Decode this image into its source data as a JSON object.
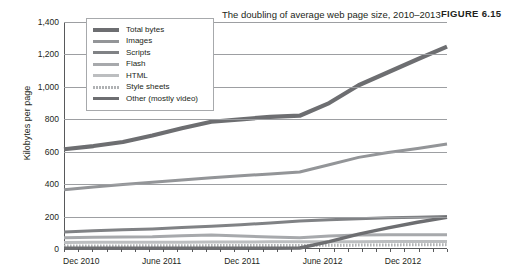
{
  "figure": {
    "label": "FIGURE 6.15"
  },
  "chart_data": {
    "type": "line",
    "title": "The doubling of average web page size, 2010–2013",
    "xlabel": "",
    "ylabel": "Kilobytes per page",
    "ylim": [
      0,
      1400
    ],
    "yticks": [
      "0",
      "200",
      "400",
      "600",
      "800",
      "1,000",
      "1,200",
      "1,400"
    ],
    "ytick_values": [
      0,
      200,
      400,
      600,
      800,
      1000,
      1200,
      1400
    ],
    "xtick_labels": [
      "Dec 2010",
      "June 2011",
      "Dec 2011",
      "June 2012",
      "Dec 2012"
    ],
    "xtick_positions": [
      0.045,
      0.255,
      0.465,
      0.675,
      0.885
    ],
    "grid": true,
    "legend_position": "top-left",
    "x": [
      0,
      1,
      2,
      3,
      4,
      5,
      6,
      7,
      8,
      9,
      10,
      11,
      12,
      13
    ],
    "series": [
      {
        "name": "Total bytes",
        "color": "#6d6e71",
        "width": 4.2,
        "dash": "none",
        "values": [
          615,
          635,
          660,
          700,
          745,
          785,
          800,
          815,
          822,
          900,
          1010,
          1090,
          1170,
          1248
        ]
      },
      {
        "name": "Images",
        "color": "#939598",
        "width": 3.0,
        "dash": "none",
        "values": [
          365,
          382,
          398,
          412,
          425,
          440,
          452,
          462,
          475,
          520,
          565,
          595,
          620,
          648
        ]
      },
      {
        "name": "Scripts",
        "color": "#808285",
        "width": 3.0,
        "dash": "none",
        "values": [
          105,
          112,
          118,
          124,
          132,
          140,
          150,
          160,
          172,
          180,
          186,
          192,
          196,
          200
        ]
      },
      {
        "name": "Flash",
        "color": "#a7a9ac",
        "width": 3.0,
        "dash": "none",
        "values": [
          70,
          72,
          74,
          76,
          82,
          86,
          80,
          74,
          70,
          80,
          86,
          88,
          88,
          88
        ]
      },
      {
        "name": "HTML",
        "color": "#bcbec0",
        "width": 3.0,
        "dash": "none",
        "values": [
          40,
          41,
          41,
          42,
          42,
          43,
          43,
          44,
          44,
          45,
          45,
          46,
          46,
          47
        ]
      },
      {
        "name": "Style sheets",
        "color": "#b0b2b4",
        "width": 3.0,
        "dash": "dotted",
        "values": [
          18,
          19,
          19,
          20,
          20,
          21,
          21,
          22,
          22,
          23,
          24,
          25,
          26,
          27
        ]
      },
      {
        "name": "Other (mostly video)",
        "color": "#6d6e71",
        "width": 3.4,
        "dash": "none",
        "values": [
          5,
          5,
          5,
          5,
          5,
          5,
          5,
          5,
          6,
          45,
          92,
          130,
          165,
          195
        ]
      }
    ]
  }
}
